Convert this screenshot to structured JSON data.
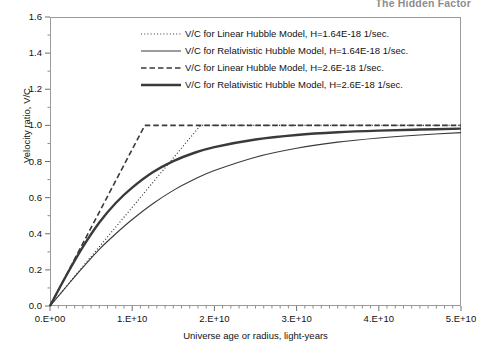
{
  "page": {
    "header_text": "The Hidden Factor"
  },
  "chart_data": {
    "type": "line",
    "title": "",
    "xlabel": "Universe age or radius, light-years",
    "ylabel": "Velocity ratio, V/C",
    "xlim": [
      0,
      50000000000
    ],
    "ylim": [
      0,
      1.6
    ],
    "grid": false,
    "legend_position": "top-center-inside",
    "x_tick_labels": [
      "0.E+00",
      "1.E+10",
      "2.E+10",
      "3.E+10",
      "4.E+10",
      "5.E+10"
    ],
    "x_tick_values": [
      0,
      10000000000,
      20000000000,
      30000000000,
      40000000000,
      50000000000
    ],
    "x_minor_tick_count_per_major": 10,
    "y_tick_labels": [
      "0.0",
      "0.2",
      "0.4",
      "0.6",
      "0.8",
      "1.0",
      "1.2",
      "1.4",
      "1.6"
    ],
    "y_tick_values": [
      0.0,
      0.2,
      0.4,
      0.6,
      0.8,
      1.0,
      1.2,
      1.4,
      1.6
    ],
    "y_minor_tick_count_per_major": 2,
    "series": [
      {
        "name": "V/C for Linear Hubble Model, H=1.64E-18 1/sec.",
        "style": "dotted",
        "width": 1.2,
        "color": "#333333",
        "x": [
          0,
          2000000000,
          4000000000,
          6000000000,
          8000000000,
          10000000000,
          12000000000,
          14000000000,
          16000000000,
          17000000000,
          18000000000,
          18300000000,
          20000000000,
          25000000000,
          30000000000,
          35000000000,
          40000000000,
          45000000000,
          50000000000
        ],
        "y": [
          0.0,
          0.109,
          0.219,
          0.328,
          0.437,
          0.546,
          0.656,
          0.765,
          0.874,
          0.929,
          0.983,
          1.0,
          1.0,
          1.0,
          1.0,
          1.0,
          1.0,
          1.0,
          1.0
        ]
      },
      {
        "name": "V/C for Relativistic Hubble Model, H=1.64E-18 1/sec.",
        "style": "solid",
        "width": 1.1,
        "color": "#3a3a3a",
        "x": [
          0,
          2000000000,
          4000000000,
          6000000000,
          8000000000,
          10000000000,
          12500000000,
          15000000000,
          17500000000,
          20000000000,
          25000000000,
          30000000000,
          35000000000,
          40000000000,
          45000000000,
          50000000000
        ],
        "y": [
          0.0,
          0.108,
          0.214,
          0.314,
          0.4,
          0.479,
          0.566,
          0.64,
          0.7,
          0.75,
          0.824,
          0.873,
          0.907,
          0.93,
          0.947,
          0.96
        ]
      },
      {
        "name": "V/C for Linear Hubble Model, H=2.6E-18  1/sec.",
        "style": "dashed",
        "width": 1.6,
        "color": "#3a3a3a",
        "x": [
          0,
          2000000000,
          4000000000,
          6000000000,
          8000000000,
          10000000000,
          11000000000,
          11530000000,
          13000000000,
          20000000000,
          30000000000,
          40000000000,
          50000000000
        ],
        "y": [
          0.0,
          0.173,
          0.347,
          0.52,
          0.694,
          0.867,
          0.954,
          1.0,
          1.0,
          1.0,
          1.0,
          1.0,
          1.0
        ]
      },
      {
        "name": "V/C for Relativistic Hubble Model, H=2.6E-18  1/sec.",
        "style": "solid",
        "width": 2.4,
        "color": "#3a3a3a",
        "x": [
          0,
          2000000000,
          4000000000,
          6000000000,
          8000000000,
          10000000000,
          12500000000,
          15000000000,
          17500000000,
          20000000000,
          25000000000,
          30000000000,
          35000000000,
          40000000000,
          45000000000,
          50000000000
        ],
        "y": [
          0.0,
          0.17,
          0.327,
          0.462,
          0.57,
          0.655,
          0.74,
          0.802,
          0.847,
          0.88,
          0.922,
          0.947,
          0.962,
          0.971,
          0.977,
          0.982
        ]
      }
    ]
  },
  "legend": {
    "items": [
      {
        "label": "V/C for Linear Hubble Model, H=1.64E-18 1/sec.",
        "style": "dotted"
      },
      {
        "label": "V/C for Relativistic Hubble Model, H=1.64E-18 1/sec.",
        "style": "solid-thin"
      },
      {
        "label": "V/C for Linear Hubble Model, H=2.6E-18  1/sec.",
        "style": "dashed"
      },
      {
        "label": "V/C for Relativistic Hubble Model, H=2.6E-18  1/sec.",
        "style": "solid-thick"
      }
    ]
  }
}
